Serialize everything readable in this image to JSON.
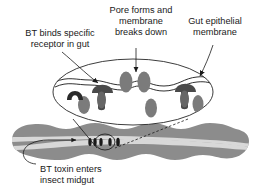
{
  "figure": {
    "background_color": "#ffffff",
    "width": 256,
    "height": 192
  },
  "labels": {
    "binds": {
      "id": "bt-binds-receptor",
      "line1": "BT binds specific",
      "line2": "receptor in gut",
      "align": "center"
    },
    "pore": {
      "id": "pore-forms-membrane-breaks-down",
      "line1": "Pore forms and",
      "line2": "membrane",
      "line3": "breaks down",
      "align": "center"
    },
    "epithelial": {
      "id": "gut-epithelial-membrane",
      "line1": "Gut epithelial",
      "line2": "membrane",
      "align": "center"
    },
    "midgut": {
      "id": "bt-toxin-enters-insect-midgut",
      "line1": "BT toxin enters",
      "line2": "insect midgut",
      "align": "left"
    }
  },
  "diagram": {
    "magnified_cell": {
      "name": "gut-epithelial-cell-magnified",
      "shape": "ellipse",
      "center_x": 133,
      "center_y": 92,
      "radius_x": 80,
      "radius_y": 33
    },
    "membrane_line": {
      "name": "epithelial-membrane-wavy-line",
      "style": "wavy"
    },
    "receptors": [
      {
        "name": "receptor-unbound-arch",
        "state": "unbound",
        "x": 75,
        "y": 92,
        "fill": "#2a2a2a"
      },
      {
        "name": "receptor-bound-toxin-left",
        "state": "bound",
        "x": 102,
        "y": 91,
        "fill": "#555555"
      },
      {
        "name": "receptor-bound-toxin-right",
        "state": "bound",
        "x": 185,
        "y": 90,
        "fill": "#555555"
      }
    ],
    "toxin_blobs": [
      {
        "name": "toxin-blob-1",
        "x": 84,
        "y": 104,
        "rx": 6,
        "ry": 9,
        "fill": "#7b7b7b"
      },
      {
        "name": "toxin-blob-2",
        "x": 126,
        "y": 82,
        "rx": 6.5,
        "ry": 10,
        "fill": "#7b7b7b"
      },
      {
        "name": "toxin-blob-3",
        "x": 144,
        "y": 82,
        "rx": 6.5,
        "ry": 10,
        "fill": "#7b7b7b"
      },
      {
        "name": "toxin-blob-4",
        "x": 151,
        "y": 107,
        "rx": 6,
        "ry": 9.5,
        "fill": "#7b7b7b"
      },
      {
        "name": "toxin-blob-5",
        "x": 197,
        "y": 104,
        "rx": 5.5,
        "ry": 9,
        "fill": "#7b7b7b"
      }
    ],
    "pore": {
      "name": "membrane-pore-gap",
      "between": [
        "toxin-blob-2",
        "toxin-blob-3"
      ],
      "x": 135,
      "y": 82
    },
    "midgut": {
      "name": "insect-midgut-tube",
      "body_fill": "#8c8c8c",
      "lumen_fill": "#d8d8d8",
      "lobe_count": 9,
      "left_x": 12,
      "right_x": 248,
      "center_y": 141
    },
    "midgut_callout_circle": {
      "name": "midgut-magnification-circle",
      "x": 105,
      "y": 142,
      "rx": 10,
      "ry": 8
    },
    "midgut_toxin_dots": [
      {
        "name": "midgut-toxin-dot-1",
        "x": 90,
        "y": 142
      },
      {
        "name": "midgut-toxin-dot-2",
        "x": 95,
        "y": 142
      },
      {
        "name": "midgut-toxin-dot-3",
        "x": 101,
        "y": 142
      },
      {
        "name": "midgut-toxin-dot-4",
        "x": 110,
        "y": 142
      },
      {
        "name": "midgut-toxin-dot-5",
        "x": 118,
        "y": 142
      }
    ],
    "flow_arrow": {
      "name": "toxin-flow-arrow",
      "from_x": 48,
      "to_x": 78,
      "y": 140,
      "direction": "right"
    },
    "leader_lines": [
      {
        "name": "leader-binds-to-receptor",
        "type": "arrow"
      },
      {
        "name": "leader-pore-to-membrane",
        "type": "arrow"
      },
      {
        "name": "leader-epithelial-to-membrane",
        "type": "arrow"
      },
      {
        "name": "leader-midgut-hook",
        "type": "curve"
      },
      {
        "name": "leader-magnify-left",
        "type": "line"
      },
      {
        "name": "leader-magnify-right",
        "type": "line"
      }
    ]
  },
  "colors": {
    "ink": "#1a1a1a",
    "toxin_gray": "#7b7b7b",
    "receptor_dark": "#2a2a2a",
    "receptor_mid": "#555555",
    "gut_body": "#8c8c8c",
    "gut_lumen": "#d8d8d8",
    "background": "#ffffff"
  }
}
